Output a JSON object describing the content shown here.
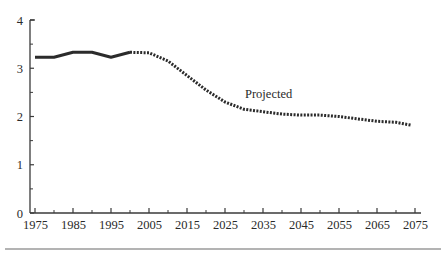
{
  "chart_data": {
    "type": "line",
    "title": "",
    "xlabel": "",
    "ylabel": "",
    "xlim": [
      1975,
      2075
    ],
    "ylim": [
      0,
      4
    ],
    "grid": false,
    "legend": null,
    "x_ticks": [
      1975,
      1985,
      1995,
      2005,
      2015,
      2025,
      2035,
      2045,
      2055,
      2065,
      2075
    ],
    "x_minor_ticks": [
      1980,
      1990,
      2000,
      2010,
      2020,
      2030,
      2040,
      2050,
      2060,
      2070
    ],
    "y_ticks": [
      0,
      1,
      2,
      3,
      4
    ],
    "y_minor_ticks": [
      0.5,
      1.5,
      2.5,
      3.5
    ],
    "series": [
      {
        "name": "Historical",
        "style": "solid",
        "x": [
          1975,
          1980,
          1985,
          1990,
          1995,
          2000
        ],
        "values": [
          3.23,
          3.23,
          3.33,
          3.33,
          3.23,
          3.33
        ]
      },
      {
        "name": "Projected",
        "style": "dotted",
        "x": [
          2000,
          2005,
          2010,
          2015,
          2020,
          2025,
          2030,
          2035,
          2040,
          2045,
          2050,
          2055,
          2060,
          2065,
          2070,
          2074
        ],
        "values": [
          3.33,
          3.32,
          3.15,
          2.85,
          2.55,
          2.3,
          2.15,
          2.1,
          2.05,
          2.03,
          2.03,
          2.0,
          1.95,
          1.9,
          1.88,
          1.82
        ]
      }
    ],
    "annotations": [
      {
        "text": "Projected",
        "x": 2028,
        "y": 2.4
      }
    ]
  },
  "colors": {
    "line": "#2b2b2b",
    "axis": "#3a3a3a",
    "rule": "#9a9a9a"
  }
}
